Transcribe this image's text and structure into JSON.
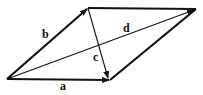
{
  "diagram": {
    "type": "vector-parallelogram",
    "vertices": {
      "origin": [
        7,
        79
      ],
      "top_left": [
        88,
        8
      ],
      "top_right": [
        196,
        9
      ],
      "bottom_right": [
        110,
        80
      ]
    },
    "vectors": [
      {
        "name": "a",
        "from": "origin",
        "to": "bottom_right",
        "label": "a",
        "label_pos": [
          63,
          89
        ],
        "weight": "thick"
      },
      {
        "name": "b",
        "from": "origin",
        "to": "top_left",
        "label": "b",
        "label_pos": [
          44,
          38
        ],
        "weight": "thick"
      },
      {
        "name": "c",
        "from": "top_left",
        "to": "bottom_right",
        "label": "c",
        "label_pos": [
          94,
          61
        ],
        "weight": "thin"
      },
      {
        "name": "d",
        "from": "origin",
        "to": "top_right",
        "label": "d",
        "label_pos": [
          124,
          32
        ],
        "weight": "thin"
      }
    ],
    "sides": [
      {
        "from": "top_left",
        "to": "top_right"
      },
      {
        "from": "bottom_right",
        "to": "top_right"
      }
    ],
    "color": "#111111"
  }
}
